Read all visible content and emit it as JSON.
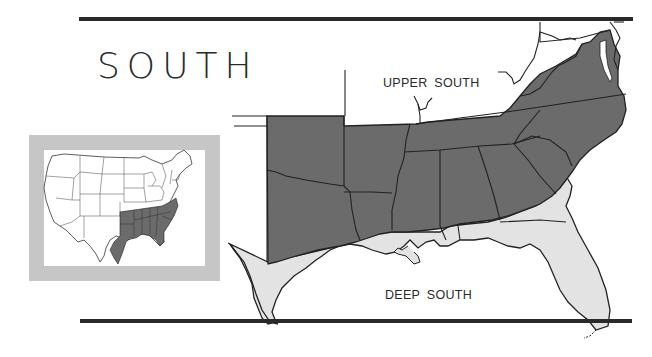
{
  "title": "SOUTH",
  "regions": {
    "upper_label": "UPPER SOUTH",
    "deep_label": "DEEP SOUTH"
  },
  "legend_colors": {
    "upper_south_fill": "#6b6b6b",
    "deep_south_fill": "#e3e3e3",
    "inset_frame": "#c6c6c6",
    "rule_color": "#2a2a2a"
  },
  "inset": {
    "description": "Contiguous United States with Southern states highlighted"
  }
}
